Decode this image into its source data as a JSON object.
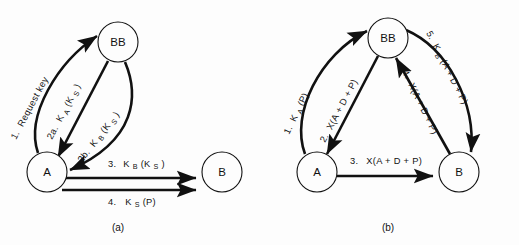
{
  "figure": {
    "background_color": "#fdfdfd",
    "ink_color": "#111111",
    "panels": [
      {
        "id": "panel-a",
        "caption": "(a)",
        "caption_x": 118,
        "caption_y": 231,
        "nodes": [
          {
            "id": "bb",
            "label": "BB",
            "cx": 118,
            "cy": 42,
            "r": 20
          },
          {
            "id": "a",
            "label": "A",
            "cx": 47,
            "cy": 172,
            "r": 20
          },
          {
            "id": "b",
            "label": "B",
            "cx": 222,
            "cy": 172,
            "r": 20
          }
        ],
        "edges": [
          {
            "id": "a-edge-1",
            "from": "a",
            "to": "bb",
            "number": "1.",
            "text": "Request key",
            "sub": "",
            "tail": "",
            "shape": "curve-left",
            "label_x": 16,
            "label_y": 140,
            "label_rotate": -62
          },
          {
            "id": "a-edge-2a",
            "from": "bb",
            "to": "a",
            "number": "2a.",
            "text": "K",
            "sub": "A",
            "tail": " (K",
            "sub2": "S",
            "tail2": ")",
            "shape": "straight",
            "label_x": 52,
            "label_y": 140,
            "label_rotate": -62
          },
          {
            "id": "a-edge-2b",
            "from": "bb",
            "to": "a",
            "number": "2b.",
            "text": "K",
            "sub": "B",
            "tail": " (K",
            "sub2": "S",
            "tail2": ")",
            "shape": "curve-right",
            "label_x": 82,
            "label_y": 163,
            "label_rotate": -52
          },
          {
            "id": "a-edge-3",
            "from": "a",
            "to": "b",
            "number": "3.",
            "text": "K",
            "sub": "B",
            "tail": " (K",
            "sub2": "S",
            "tail2": ")",
            "shape": "horizontal-top",
            "label_x": 108,
            "label_y": 167,
            "label_rotate": 0
          },
          {
            "id": "a-edge-4",
            "from": "a",
            "to": "b",
            "number": "4.",
            "text": "K",
            "sub": "S",
            "tail": " (P)",
            "sub2": "",
            "tail2": "",
            "shape": "horizontal-bottom",
            "label_x": 108,
            "label_y": 205,
            "label_rotate": 0
          }
        ]
      },
      {
        "id": "panel-b",
        "caption": "(b)",
        "caption_x": 388,
        "caption_y": 231,
        "nodes": [
          {
            "id": "bb",
            "label": "BB",
            "cx": 388,
            "cy": 38,
            "r": 20
          },
          {
            "id": "a",
            "label": "A",
            "cx": 317,
            "cy": 172,
            "r": 20
          },
          {
            "id": "b",
            "label": "B",
            "cx": 459,
            "cy": 172,
            "r": 20
          }
        ],
        "edges": [
          {
            "id": "b-edge-1",
            "from": "a",
            "to": "bb",
            "number": "1.",
            "text": "K",
            "sub": "A",
            "tail": " (P)",
            "sub2": "",
            "tail2": "",
            "shape": "curve-left",
            "label_x": 289,
            "label_y": 135,
            "label_rotate": -64
          },
          {
            "id": "b-edge-2",
            "from": "bb",
            "to": "a",
            "number": "2.",
            "text": "X(A + D + P)",
            "sub": "",
            "tail": "",
            "shape": "straight",
            "label_x": 325,
            "label_y": 143,
            "label_rotate": -62
          },
          {
            "id": "b-edge-3",
            "from": "a",
            "to": "b",
            "number": "3.",
            "text": "X(A + D + P)",
            "sub": "",
            "tail": "",
            "shape": "horizontal",
            "label_x": 350,
            "label_y": 164,
            "label_rotate": 0
          },
          {
            "id": "b-edge-4",
            "from": "b",
            "to": "bb",
            "number": "4.",
            "text": "X(A + D + P)",
            "sub": "",
            "tail": "",
            "shape": "straight",
            "label_x": 402,
            "label_y": 72,
            "label_rotate": 64
          },
          {
            "id": "b-edge-5",
            "from": "bb",
            "to": "b",
            "number": "5.",
            "text": "K",
            "sub": "B",
            "tail": "(A + D + P)",
            "sub2": "",
            "tail2": "",
            "shape": "curve-right",
            "label_x": 426,
            "label_y": 33,
            "label_rotate": 63
          }
        ]
      }
    ]
  }
}
